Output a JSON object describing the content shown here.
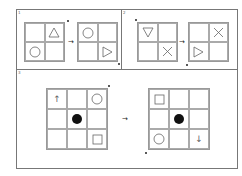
{
  "panels": [
    {
      "label": "1",
      "left_grid": {
        "size": 2,
        "cells": [
          "",
          "triangle-up",
          "circle",
          ""
        ]
      },
      "right_grid": {
        "size": 2,
        "cells": [
          "circle",
          "",
          "",
          "triangle-right"
        ]
      },
      "connector": "→"
    },
    {
      "label": "2",
      "left_grid": {
        "size": 2,
        "cells": [
          "triangle-down",
          "",
          "",
          "cross"
        ]
      },
      "right_grid": {
        "size": 2,
        "cells": [
          "",
          "cross",
          "triangle-right",
          ""
        ]
      },
      "connector": "→"
    },
    {
      "label": "3",
      "left_grid": {
        "size": 3,
        "cells": [
          "arrow-up",
          "",
          "circle",
          "",
          "filled-circle",
          "",
          "",
          "",
          "square"
        ]
      },
      "right_grid": {
        "size": 3,
        "cells": [
          "square",
          "",
          "",
          "",
          "filled-circle",
          "",
          "circle",
          "",
          "arrow-down"
        ]
      },
      "connector": "→"
    }
  ],
  "glyphs": {
    "arrow-up": "↑",
    "arrow-down": "↓",
    "connector": "→"
  },
  "colors": {
    "line": "#999999",
    "shape": "#666666",
    "fill": "#111111"
  }
}
